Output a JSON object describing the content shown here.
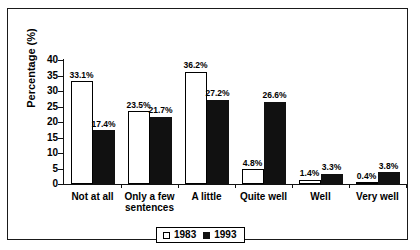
{
  "chart_data": {
    "type": "bar",
    "title": "",
    "subtitle": "",
    "xlabel": "",
    "ylabel": "Percentage (%)",
    "ylim": [
      0,
      40
    ],
    "ytick_labels": [
      "0",
      "5",
      "10",
      "15",
      "20",
      "25",
      "30",
      "35",
      "40"
    ],
    "ytick_values": [
      0,
      5,
      10,
      15,
      20,
      25,
      30,
      35,
      40
    ],
    "grid": false,
    "legend_position": "bottom-center",
    "value_label_suffix": "%",
    "categories": [
      "Not at all",
      "Only a few sentences",
      "A little",
      "Quite well",
      "Well",
      "Very well"
    ],
    "series": [
      {
        "name": "1983",
        "color": "#ffffff",
        "values": [
          33.1,
          23.5,
          36.2,
          4.8,
          1.4,
          0.4
        ],
        "value_labels": [
          "33.1%",
          "23.5%",
          "36.2%",
          "4.8%",
          "1.4%",
          "0.4%"
        ]
      },
      {
        "name": "1993",
        "color": "#111111",
        "values": [
          17.4,
          21.7,
          27.2,
          26.6,
          3.3,
          3.8
        ],
        "value_labels": [
          "17.4%",
          "21.7%",
          "27.2%",
          "26.6%",
          "3.3%",
          "3.8%"
        ]
      }
    ]
  },
  "legend": {
    "items": [
      {
        "label": "1983",
        "swatch": "white-square"
      },
      {
        "label": "1993",
        "swatch": "black-square"
      }
    ]
  },
  "category_lines": [
    [
      "Not at all"
    ],
    [
      "Only a few",
      "sentences"
    ],
    [
      "A little"
    ],
    [
      "Quite well"
    ],
    [
      "Well"
    ],
    [
      "Very well"
    ]
  ]
}
